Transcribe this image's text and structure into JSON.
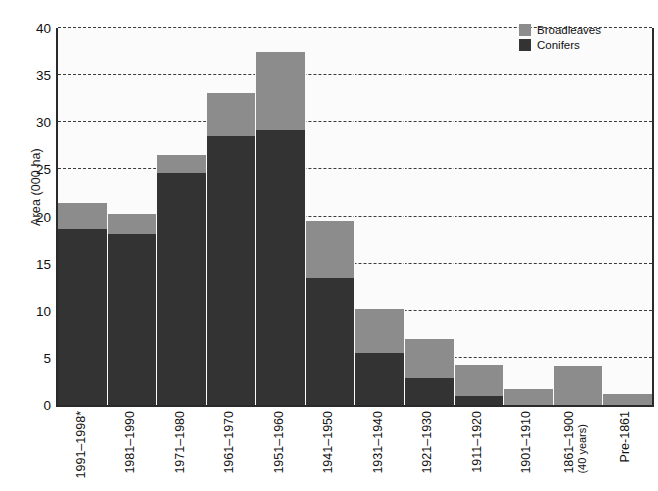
{
  "chart_data": {
    "type": "bar",
    "title": "",
    "subtitle": "",
    "xlabel": "",
    "ylabel": "Area (000 ha)",
    "ylim": [
      0,
      40
    ],
    "yticks": [
      0,
      5,
      10,
      15,
      20,
      25,
      30,
      35,
      40
    ],
    "ytick_labels": [
      "0",
      "5",
      "10",
      "15",
      "20",
      "25",
      "30",
      "35",
      "40"
    ],
    "grid": true,
    "stacked": true,
    "legend_position": "top-right",
    "categories": [
      "1991–1998*",
      "1981–1990",
      "1971–1980",
      "1961–1970",
      "1951–1960",
      "1941–1950",
      "1931–1940",
      "1921–1930",
      "1911–1920",
      "1901–1910",
      "1861–1900",
      "Pre-1861"
    ],
    "category_sublabels": [
      "",
      "",
      "",
      "",
      "",
      "",
      "",
      "",
      "",
      "",
      "(40 years)",
      ""
    ],
    "series": [
      {
        "name": "Conifers",
        "color": "#333333",
        "values": [
          18.7,
          18.1,
          24.6,
          28.5,
          29.2,
          13.5,
          5.5,
          2.9,
          1.0,
          0.0,
          0.0,
          0.0
        ]
      },
      {
        "name": "Broadleaves",
        "color": "#8c8c8c",
        "values": [
          2.7,
          2.2,
          1.9,
          4.6,
          8.3,
          6.0,
          4.7,
          4.1,
          3.2,
          1.7,
          4.1,
          1.2
        ]
      }
    ],
    "totals": [
      21.4,
      20.3,
      26.5,
      33.1,
      37.5,
      19.5,
      10.2,
      7.0,
      4.2,
      1.7,
      4.1,
      1.2
    ]
  },
  "legend": {
    "items": [
      {
        "label": "Broadleaves",
        "color": "#8c8c8c"
      },
      {
        "label": "Conifers",
        "color": "#333333"
      }
    ]
  },
  "colors": {
    "broadleaves": "#8c8c8c",
    "conifers": "#333333",
    "plot_background": "#fbfbfb",
    "axis": "#2a2a2a",
    "gridline": "#3a3a3a",
    "text": "#111111"
  }
}
